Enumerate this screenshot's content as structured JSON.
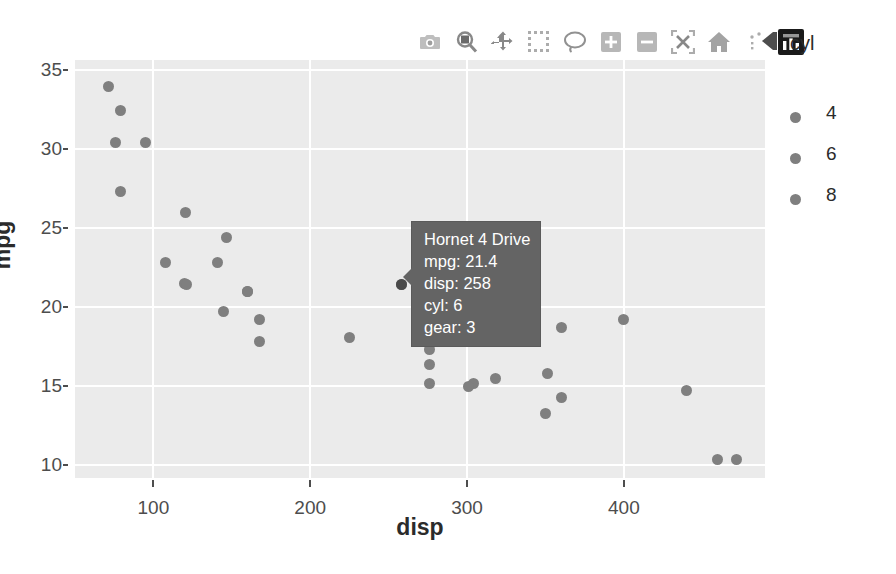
{
  "chart_data": {
    "type": "scatter",
    "title": "",
    "xlabel": "disp",
    "ylabel": "mpg",
    "xlim": [
      50,
      490
    ],
    "ylim": [
      9.2,
      35.6
    ],
    "xticks": [
      100,
      200,
      300,
      400
    ],
    "yticks": [
      10,
      15,
      20,
      25,
      30,
      35
    ],
    "grid": true,
    "legend": {
      "title": "cyl",
      "position": "right",
      "entries": [
        {
          "label": "4",
          "color": "#7f7f7f"
        },
        {
          "label": "6",
          "color": "#7f7f7f"
        },
        {
          "label": "8",
          "color": "#7f7f7f"
        }
      ]
    },
    "marker_color": "#7f7f7f",
    "panel_background": "#ebebeb",
    "points": [
      {
        "name": "Toyota Corolla",
        "disp": 71.1,
        "mpg": 33.9,
        "cyl": 4,
        "gear": 4
      },
      {
        "name": "Fiat 128",
        "disp": 78.7,
        "mpg": 32.4,
        "cyl": 4,
        "gear": 4
      },
      {
        "name": "Honda Civic",
        "disp": 75.7,
        "mpg": 30.4,
        "cyl": 4,
        "gear": 4
      },
      {
        "name": "Lotus Europa",
        "disp": 95.1,
        "mpg": 30.4,
        "cyl": 4,
        "gear": 5
      },
      {
        "name": "Fiat X1-9",
        "disp": 79.0,
        "mpg": 27.3,
        "cyl": 4,
        "gear": 4
      },
      {
        "name": "Porsche 914-2",
        "disp": 120.3,
        "mpg": 26.0,
        "cyl": 4,
        "gear": 5
      },
      {
        "name": "Merc 240D",
        "disp": 146.7,
        "mpg": 24.4,
        "cyl": 4,
        "gear": 4
      },
      {
        "name": "Datsun 710",
        "disp": 108.0,
        "mpg": 22.8,
        "cyl": 4,
        "gear": 4
      },
      {
        "name": "Merc 230",
        "disp": 140.8,
        "mpg": 22.8,
        "cyl": 4,
        "gear": 4
      },
      {
        "name": "Toyota Corona",
        "disp": 120.1,
        "mpg": 21.5,
        "cyl": 4,
        "gear": 3
      },
      {
        "name": "Hornet 4 Drive",
        "disp": 258.0,
        "mpg": 21.4,
        "cyl": 6,
        "gear": 3
      },
      {
        "name": "Volvo 142E",
        "disp": 121.0,
        "mpg": 21.4,
        "cyl": 4,
        "gear": 4
      },
      {
        "name": "Mazda RX4",
        "disp": 160.0,
        "mpg": 21.0,
        "cyl": 6,
        "gear": 4
      },
      {
        "name": "Mazda RX4 Wag",
        "disp": 160.0,
        "mpg": 21.0,
        "cyl": 6,
        "gear": 4
      },
      {
        "name": "Ferrari Dino",
        "disp": 145.0,
        "mpg": 19.7,
        "cyl": 6,
        "gear": 5
      },
      {
        "name": "Merc 280",
        "disp": 167.6,
        "mpg": 19.2,
        "cyl": 6,
        "gear": 4
      },
      {
        "name": "Pontiac Firebird",
        "disp": 400.0,
        "mpg": 19.2,
        "cyl": 8,
        "gear": 3
      },
      {
        "name": "Hornet Sportabout",
        "disp": 360.0,
        "mpg": 18.7,
        "cyl": 8,
        "gear": 3
      },
      {
        "name": "Valiant",
        "disp": 225.0,
        "mpg": 18.1,
        "cyl": 6,
        "gear": 3
      },
      {
        "name": "Merc 280C",
        "disp": 167.6,
        "mpg": 17.8,
        "cyl": 6,
        "gear": 4
      },
      {
        "name": "Merc 450SE",
        "disp": 275.8,
        "mpg": 16.4,
        "cyl": 8,
        "gear": 3
      },
      {
        "name": "Ford Pantera L",
        "disp": 351.0,
        "mpg": 15.8,
        "cyl": 8,
        "gear": 5
      },
      {
        "name": "Merc 450SL",
        "disp": 275.8,
        "mpg": 17.3,
        "cyl": 8,
        "gear": 3
      },
      {
        "name": "Dodge Challenger",
        "disp": 318.0,
        "mpg": 15.5,
        "cyl": 8,
        "gear": 3
      },
      {
        "name": "AMC Javelin",
        "disp": 304.0,
        "mpg": 15.2,
        "cyl": 8,
        "gear": 3
      },
      {
        "name": "Merc 450SLC",
        "disp": 275.8,
        "mpg": 15.2,
        "cyl": 8,
        "gear": 3
      },
      {
        "name": "Maserati Bora",
        "disp": 301.0,
        "mpg": 15.0,
        "cyl": 8,
        "gear": 5
      },
      {
        "name": "Chrysler Imperial",
        "disp": 440.0,
        "mpg": 14.7,
        "cyl": 8,
        "gear": 3
      },
      {
        "name": "Duster 360",
        "disp": 360.0,
        "mpg": 14.3,
        "cyl": 8,
        "gear": 3
      },
      {
        "name": "Camaro Z28",
        "disp": 350.0,
        "mpg": 13.3,
        "cyl": 8,
        "gear": 3
      },
      {
        "name": "Cadillac Fleetwood",
        "disp": 472.0,
        "mpg": 10.4,
        "cyl": 8,
        "gear": 3
      },
      {
        "name": "Lincoln Continental",
        "disp": 460.0,
        "mpg": 10.4,
        "cyl": 8,
        "gear": 3
      }
    ]
  },
  "tooltip": {
    "name": "Hornet 4 Drive",
    "rows": [
      "mpg: 21.4",
      "disp: 258",
      "cyl: 6",
      "gear: 3"
    ],
    "background": "#646464",
    "text_color": "#ffffff"
  },
  "cyl_chip": {
    "label": "cyl"
  },
  "modebar": {
    "buttons": [
      {
        "icon": "camera-icon",
        "tooltip": "Download plot as a png"
      },
      {
        "icon": "zoom-icon",
        "tooltip": "Zoom"
      },
      {
        "icon": "pan-icon",
        "tooltip": "Pan"
      },
      {
        "icon": "box-select-icon",
        "tooltip": "Box Select"
      },
      {
        "icon": "lasso-select-icon",
        "tooltip": "Lasso Select"
      },
      {
        "icon": "zoom-in-icon",
        "tooltip": "Zoom in"
      },
      {
        "icon": "zoom-out-icon",
        "tooltip": "Zoom out"
      },
      {
        "icon": "autoscale-icon",
        "tooltip": "Autoscale"
      },
      {
        "icon": "home-icon",
        "tooltip": "Reset axes"
      },
      {
        "icon": "spike-lines-icon",
        "tooltip": "Toggle Spike Lines"
      },
      {
        "icon": "bar-chart-icon",
        "tooltip": "Toggle show closest data on hover"
      }
    ]
  }
}
